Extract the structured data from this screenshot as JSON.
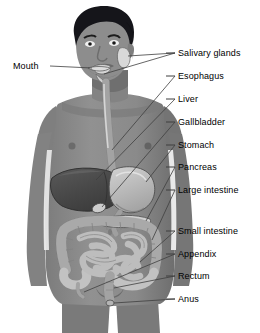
{
  "figure": {
    "style": "grayscale medical illustration",
    "colors": {
      "background": "#ffffff",
      "skin": "#8a8a8a",
      "skin_shadow": "#6f6f6f",
      "skin_light": "#9c9c9c",
      "hair": "#15151a",
      "liver": "#4a4a4a",
      "organ_light": "#c9c9c9",
      "organ_mid": "#a8a8a8",
      "outline": "#3a3a3a",
      "leader": "#444444",
      "text": "#000000"
    }
  },
  "labels": {
    "mouth": {
      "text": "Mouth",
      "side": "left",
      "x": 13,
      "y": 62
    },
    "salivary_glands": {
      "text": "Salivary glands",
      "side": "right",
      "x": 178,
      "y": 50
    },
    "esophagus": {
      "text": "Esophagus",
      "side": "right",
      "x": 178,
      "y": 73
    },
    "liver": {
      "text": "Liver",
      "side": "right",
      "x": 178,
      "y": 96
    },
    "gallbladder": {
      "text": "Gallbladder",
      "side": "right",
      "x": 178,
      "y": 119
    },
    "stomach": {
      "text": "Stomach",
      "side": "right",
      "x": 178,
      "y": 142
    },
    "pancreas": {
      "text": "Pancreas",
      "side": "right",
      "x": 178,
      "y": 164
    },
    "large_intestine": {
      "text": "Large intestine",
      "side": "right",
      "x": 178,
      "y": 187
    },
    "small_intestine": {
      "text": "Small intestine",
      "side": "right",
      "x": 178,
      "y": 228
    },
    "appendix": {
      "text": "Appendix",
      "side": "right",
      "x": 178,
      "y": 251
    },
    "rectum": {
      "text": "Rectum",
      "side": "right",
      "x": 178,
      "y": 273
    },
    "anus": {
      "text": "Anus",
      "side": "right",
      "x": 178,
      "y": 296
    }
  }
}
